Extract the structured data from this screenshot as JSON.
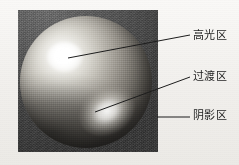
{
  "figure": {
    "kind": "grayscale-photo-diagram",
    "panel": {
      "x": 18,
      "y": 10,
      "width": 140,
      "height": 142
    }
  },
  "colors": {
    "paper": "#f4f2ef",
    "panel_background_dark": "#3f3f3f",
    "sphere_highlight": "#ffffff",
    "sphere_midtone": "#a4a098",
    "sphere_core_shadow": "#33312e",
    "leader_line": "#1d1d1d",
    "label_text": "#1d1d1d"
  },
  "annotations": [
    {
      "id": "highlight",
      "label": "高光区",
      "name": "label-highlight",
      "leader": {
        "x1": 68,
        "y1": 58,
        "x2": 190,
        "y2": 35
      },
      "label_pos": {
        "x": 193,
        "y": 29
      }
    },
    {
      "id": "transition",
      "label": "过渡区",
      "name": "label-transition",
      "leader": {
        "x1": 95,
        "y1": 112,
        "x2": 190,
        "y2": 77
      },
      "label_pos": {
        "x": 193,
        "y": 70
      }
    },
    {
      "id": "shadow",
      "label": "阴影区",
      "name": "label-shadow",
      "leader": {
        "x1": 157,
        "y1": 117,
        "x2": 190,
        "y2": 117
      },
      "label_pos": {
        "x": 193,
        "y": 109
      }
    }
  ],
  "sphere": {
    "center": {
      "x": 68,
      "y": 82
    },
    "radius": 66,
    "specular_center": {
      "x": 63,
      "y": 57
    },
    "reflected_light_center": {
      "x": 109,
      "y": 117
    }
  }
}
